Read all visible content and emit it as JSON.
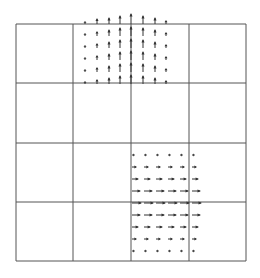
{
  "figure": {
    "width": 260,
    "height": 278,
    "background": "#ffffff",
    "line_color": "#555555",
    "arrow_color": "#333333"
  },
  "grid": {
    "x_lines": [
      16,
      73,
      131,
      189,
      246
    ],
    "y_lines": [
      24,
      83,
      143,
      202,
      261
    ]
  },
  "fields": [
    {
      "name": "upward-vector-field",
      "direction": "up",
      "columns_x": [
        85,
        97,
        109,
        120,
        131,
        143,
        155,
        166
      ],
      "rows_y": [
        84,
        72,
        60,
        48,
        36,
        24
      ],
      "lengths": [
        [
          2,
          4,
          6,
          8,
          9,
          8,
          6,
          3
        ],
        [
          2,
          4,
          6,
          8,
          9,
          8,
          6,
          3
        ],
        [
          2,
          4,
          6,
          8,
          9,
          8,
          6,
          3
        ],
        [
          2,
          4,
          6,
          8,
          9,
          8,
          6,
          3
        ],
        [
          2,
          4,
          6,
          8,
          9,
          8,
          6,
          3
        ],
        [
          2,
          5,
          6,
          8,
          10,
          8,
          6,
          3
        ]
      ]
    },
    {
      "name": "rightward-vector-field",
      "direction": "right",
      "columns_x": [
        132,
        144,
        156,
        168,
        180,
        192
      ],
      "rows_y": [
        155,
        167,
        179,
        191,
        203,
        215,
        227,
        239,
        251
      ],
      "lengths": [
        [
          2,
          2,
          2,
          2,
          2,
          2
        ],
        [
          4,
          4,
          4,
          4,
          4,
          4
        ],
        [
          6,
          6,
          6,
          6,
          6,
          6
        ],
        [
          8,
          8,
          8,
          8,
          8,
          8
        ],
        [
          9,
          9,
          9,
          9,
          9,
          9
        ],
        [
          8,
          8,
          8,
          8,
          8,
          8
        ],
        [
          6,
          6,
          6,
          6,
          6,
          6
        ],
        [
          4,
          4,
          4,
          4,
          4,
          4
        ],
        [
          2,
          2,
          2,
          2,
          2,
          2
        ]
      ]
    }
  ]
}
